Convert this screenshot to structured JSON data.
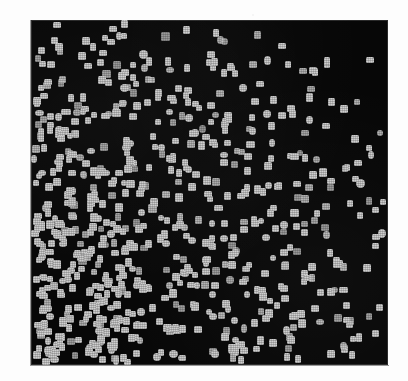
{
  "figure": {
    "title": "",
    "caption": "",
    "background_color": "#fdfdfd",
    "panel_color": "#070707",
    "marker_color": "#cfcfcf",
    "panel": {
      "x": 31,
      "y": 20,
      "width": 357,
      "height": 345
    }
  },
  "chart_data": {
    "type": "scatter",
    "title": "",
    "subtitle": "",
    "xlabel": "",
    "ylabel": "",
    "xlim": [
      0,
      100
    ],
    "ylim": [
      0,
      100
    ],
    "xticks": [],
    "yticks": [],
    "xticklabels": [],
    "yticklabels": [],
    "grid": false,
    "legend": null,
    "legend_position": "none",
    "annotations": [],
    "marker": "square",
    "marker_size_px": 7,
    "marker_color": "#cfcfcf",
    "background_color": "#070707",
    "n_points": 720,
    "density_model": {
      "kind": "gradient",
      "high_density_corner": "bottom-left",
      "low_density_corner": "top-right",
      "relative_density_grid": {
        "cols": 5,
        "rows": 5,
        "note": "rows top->bottom, cols left->right, values 0-1 relative density",
        "values": [
          [
            0.42,
            0.4,
            0.3,
            0.16,
            0.1
          ],
          [
            0.7,
            0.66,
            0.48,
            0.26,
            0.14
          ],
          [
            0.88,
            0.86,
            0.66,
            0.4,
            0.22
          ],
          [
            0.96,
            0.94,
            0.78,
            0.52,
            0.3
          ],
          [
            1.0,
            0.98,
            0.84,
            0.6,
            0.34
          ]
        ]
      }
    },
    "seed": 20240517
  }
}
